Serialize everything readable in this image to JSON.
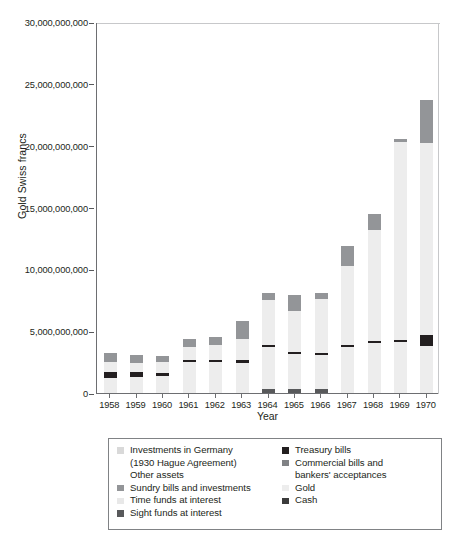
{
  "chart_data": {
    "type": "bar",
    "stacked": true,
    "title": "",
    "xlabel": "Year",
    "ylabel": "Gold Swiss francs",
    "ylim": [
      0,
      30000000000
    ],
    "yticks": [
      0,
      5000000000,
      10000000000,
      15000000000,
      20000000000,
      25000000000,
      30000000000
    ],
    "ytick_labels": [
      "0",
      "5,000,000,000",
      "10,000,000,000",
      "15,000,000,000",
      "20,000,000,000",
      "25,000,000,000",
      "30,000,000,000"
    ],
    "grid": false,
    "legend_position": "below-plot",
    "categories": [
      "1958",
      "1959",
      "1960",
      "1961",
      "1962",
      "1963",
      "1964",
      "1965",
      "1966",
      "1967",
      "1968",
      "1969",
      "1970"
    ],
    "series": [
      {
        "name": "Sight funds at interest",
        "color": "#58595b",
        "values": [
          0,
          0,
          0,
          0,
          0,
          0,
          300000000,
          350000000,
          300000000,
          0,
          0,
          0,
          0
        ]
      },
      {
        "name": "Time funds at interest",
        "color": "#e8e8e8",
        "values": [
          0,
          0,
          0,
          0,
          0,
          0,
          0,
          0,
          0,
          0,
          0,
          0,
          0
        ]
      },
      {
        "name": "Sundry bills and investments",
        "color": "#939598",
        "values": [
          0,
          0,
          0,
          0,
          0,
          0,
          0,
          0,
          0,
          0,
          0,
          0,
          0
        ]
      },
      {
        "name": "Other assets",
        "color": "#ffffff",
        "values": [
          0,
          0,
          0,
          0,
          0,
          0,
          0,
          0,
          0,
          0,
          0,
          0,
          0
        ]
      },
      {
        "name": "Investments in Germany (1930 Hague Agreement)",
        "color": "#d9d9d9",
        "values": [
          0,
          0,
          0,
          0,
          0,
          0,
          0,
          0,
          0,
          0,
          0,
          0,
          0
        ]
      },
      {
        "name": "Gold",
        "color": "#ededed",
        "values": [
          1200000000,
          1300000000,
          1400000000,
          2500000000,
          2500000000,
          2450000000,
          3400000000,
          2800000000,
          2750000000,
          3750000000,
          4050000000,
          4150000000,
          3800000000
        ]
      },
      {
        "name": "Cash",
        "color": "#231f20",
        "values": [
          500000000,
          400000000,
          200000000,
          150000000,
          150000000,
          200000000,
          200000000,
          150000000,
          150000000,
          120000000,
          120000000,
          120000000,
          900000000
        ]
      },
      {
        "name": "Treasury bills",
        "color": "#3b3b3b",
        "values": [
          0,
          0,
          0,
          0,
          0,
          0,
          0,
          0,
          0,
          0,
          0,
          0,
          0
        ]
      },
      {
        "name": "Gold (upper holdings)",
        "color": "#ededed",
        "values": [
          800000000,
          700000000,
          900000000,
          1100000000,
          1250000000,
          1750000000,
          3600000000,
          3350000000,
          4400000000,
          6400000000,
          9000000000,
          16000000000,
          15500000000
        ]
      },
      {
        "name": "Commercial bills and bankers' acceptances",
        "color": "#939598",
        "values": [
          700000000,
          700000000,
          500000000,
          600000000,
          600000000,
          1400000000,
          600000000,
          1300000000,
          500000000,
          1600000000,
          1300000000,
          300000000,
          3500000000
        ]
      }
    ],
    "bar_totals": [
      3200000000,
      3100000000,
      3000000000,
      4350000000,
      4500000000,
      5800000000,
      8100000000,
      7950000000,
      8100000000,
      11870000000,
      14470000000,
      20570000000,
      23700000000
    ]
  },
  "axis": {
    "ylabel": "Gold Swiss francs",
    "xlabel": "Year",
    "ytick_labels": [
      "30,000,000,000",
      "25,000,000,000",
      "20,000,000,000",
      "15,000,000,000",
      "10,000,000,000",
      "5,000,000,000",
      "0"
    ],
    "xtick_labels": [
      "1958",
      "1959",
      "1960",
      "1961",
      "1962",
      "1963",
      "1964",
      "1965",
      "1966",
      "1967",
      "1968",
      "1969",
      "1970"
    ]
  },
  "legend": {
    "left_column": [
      {
        "label": "Investments in Germany",
        "label2": "(1930 Hague Agreement)",
        "color": "#d9d9d9",
        "swatch": true
      },
      {
        "label": "Other assets",
        "label2": "",
        "color": "#ffffff",
        "swatch": false
      },
      {
        "label": "Sundry bills and investments",
        "label2": "",
        "color": "#939598",
        "swatch": true
      },
      {
        "label": "Time funds at interest",
        "label2": "",
        "color": "#e8e8e8",
        "swatch": true
      },
      {
        "label": "Sight funds at interest",
        "label2": "",
        "color": "#58595b",
        "swatch": true
      }
    ],
    "right_column": [
      {
        "label": "Treasury bills",
        "label2": "",
        "color": "#231f20",
        "swatch": true
      },
      {
        "label": "Commercial bills and",
        "label2": "bankers' acceptances",
        "color": "#808285",
        "swatch": true
      },
      {
        "label": "Gold",
        "label2": "",
        "color": "#ededed",
        "swatch": true
      },
      {
        "label": "Cash",
        "label2": "",
        "color": "#3b3b3b",
        "swatch": true
      }
    ]
  },
  "caption": {
    "text": ""
  }
}
